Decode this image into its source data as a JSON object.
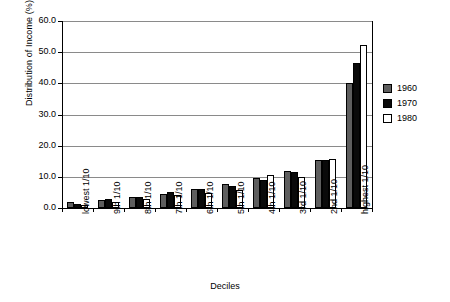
{
  "chart_data": {
    "type": "bar",
    "title": "",
    "xlabel": "Deciles",
    "ylabel": "Distribution of Income (%)",
    "ylim": [
      0.0,
      60.0
    ],
    "yticks": [
      "0.0",
      "10.0",
      "20.0",
      "30.0",
      "40.0",
      "50.0",
      "60.0"
    ],
    "ytick_values": [
      0.0,
      10.0,
      20.0,
      30.0,
      40.0,
      50.0,
      60.0
    ],
    "grid": true,
    "legend_position": "right",
    "categories": [
      "lowest 1/10",
      "9th 1/10",
      "8th 1/10",
      "7th 1/10",
      "6th 1/10",
      "5th 1/10",
      "4th 1/10",
      "3rd 1/10",
      "2nd 1/10",
      "highest 1/10"
    ],
    "series": [
      {
        "name": "1960",
        "color": "#5e5e5e",
        "values": [
          1.8,
          2.6,
          3.4,
          4.6,
          6.0,
          7.6,
          9.5,
          11.8,
          15.3,
          40.0
        ]
      },
      {
        "name": "1970",
        "color": "#0a0a0a",
        "values": [
          1.2,
          2.8,
          3.5,
          5.0,
          6.2,
          7.0,
          9.0,
          11.4,
          15.3,
          46.5
        ]
      },
      {
        "name": "1980",
        "color": "#ffffff",
        "values": [
          1.0,
          2.0,
          3.0,
          4.2,
          4.8,
          5.8,
          10.5,
          10.0,
          15.6,
          52.2
        ]
      }
    ]
  },
  "legend": {
    "items": [
      {
        "label": "1960",
        "color": "#5e5e5e"
      },
      {
        "label": "1970",
        "color": "#0a0a0a"
      },
      {
        "label": "1980",
        "color": "#ffffff"
      }
    ]
  },
  "axes": {
    "y_title": "Distribution of Income (%)",
    "x_title": "Deciles"
  }
}
